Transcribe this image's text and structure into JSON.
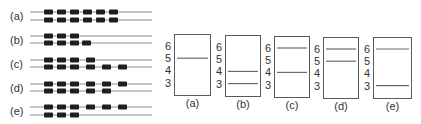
{
  "colors": {
    "line": "#8a8a8a",
    "block": "#1e1e1e",
    "box_border": "#5a5a5a",
    "band": "#6a6a6a",
    "text": "#333333"
  },
  "left_panel": {
    "block_width": 9,
    "block_height": 5,
    "line_x_start": 30,
    "line_x_end": 152,
    "rows": [
      {
        "label": "(a)",
        "label_y": 16,
        "strands": [
          {
            "y": 12,
            "blocks": [
              44,
              57,
              70,
              83,
              96,
              109
            ]
          },
          {
            "y": 20,
            "blocks": [
              44,
              57,
              70,
              83,
              96,
              109
            ]
          }
        ]
      },
      {
        "label": "(b)",
        "label_y": 40,
        "strands": [
          {
            "y": 36,
            "blocks": [
              44,
              57,
              70
            ]
          },
          {
            "y": 43,
            "blocks": [
              44,
              57,
              70,
              82
            ]
          }
        ]
      },
      {
        "label": "(c)",
        "label_y": 64,
        "strands": [
          {
            "y": 60,
            "blocks": [
              44,
              57,
              70,
              86
            ]
          },
          {
            "y": 67,
            "blocks": [
              44,
              57,
              70,
              86,
              102,
              118
            ]
          }
        ]
      },
      {
        "label": "(d)",
        "label_y": 88,
        "strands": [
          {
            "y": 84,
            "blocks": [
              44,
              57,
              70,
              86,
              102,
              118
            ]
          },
          {
            "y": 91,
            "blocks": [
              44,
              57,
              70,
              86,
              102
            ]
          }
        ]
      },
      {
        "label": "(e)",
        "label_y": 111,
        "strands": [
          {
            "y": 107,
            "blocks": [
              44,
              57,
              70,
              86,
              102,
              118
            ]
          },
          {
            "y": 115,
            "blocks": [
              44,
              57,
              70
            ]
          }
        ]
      }
    ]
  },
  "right_panel": {
    "level_labels": [
      "6",
      "5",
      "4",
      "3"
    ],
    "panels": [
      {
        "label": "(a)",
        "x": 174,
        "y": 34,
        "w": 36,
        "h": 61,
        "bands": [
          5
        ]
      },
      {
        "label": "(b)",
        "x": 225,
        "y": 35,
        "w": 35,
        "h": 61,
        "bands": [
          4,
          3
        ]
      },
      {
        "label": "(c)",
        "x": 274,
        "y": 36,
        "w": 35,
        "h": 61,
        "bands": [
          6,
          4
        ]
      },
      {
        "label": "(d)",
        "x": 323,
        "y": 37,
        "w": 35,
        "h": 61,
        "bands": [
          6,
          5
        ]
      },
      {
        "label": "(e)",
        "x": 373,
        "y": 37,
        "w": 38,
        "h": 61,
        "bands": [
          6,
          3
        ]
      }
    ]
  }
}
